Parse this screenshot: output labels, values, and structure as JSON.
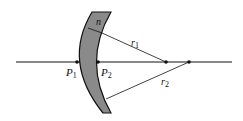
{
  "diagram": {
    "type": "thick-meniscus-lens",
    "labels": {
      "n": "n",
      "r1": "r",
      "r1_sub": "1",
      "r2": "r",
      "r2_sub": "2",
      "P1": "P",
      "P1_sub": "1",
      "P2": "P",
      "P2_sub": "2"
    },
    "colors": {
      "lens_fill": "#8a8a8a",
      "stroke": "#111111",
      "background": "#ffffff"
    }
  }
}
